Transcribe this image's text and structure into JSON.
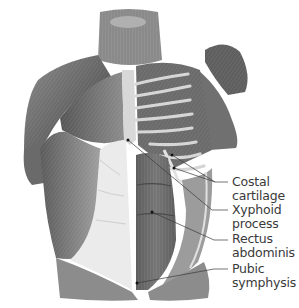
{
  "figure": {
    "palette": {
      "muscle_dark": "#4a4a4a",
      "muscle_mid": "#7a7a7a",
      "muscle_light": "#b5b5b5",
      "aponeurosis": "#e6e6e6",
      "line": "#3a3a3a"
    }
  },
  "labels": [
    {
      "id": "costal-cartilage",
      "line1": "Costal",
      "line2": "cartilage",
      "top": 175
    },
    {
      "id": "xyphoid-process",
      "line1": "Xyphoid",
      "line2": "process",
      "top": 203
    },
    {
      "id": "rectus-abdominis",
      "line1": "Rectus",
      "line2": "abdominis",
      "top": 232
    },
    {
      "id": "pubic-symphysis",
      "line1": "Pubic",
      "line2": "symphysis",
      "top": 262
    }
  ]
}
